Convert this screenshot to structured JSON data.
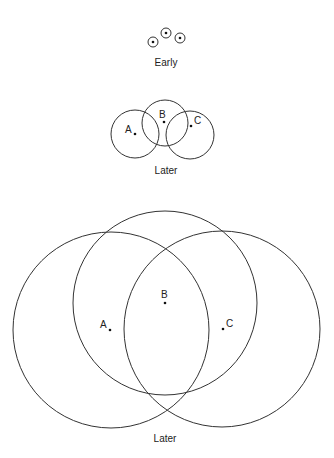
{
  "stages": [
    {
      "label": "Early",
      "circles": [
        {
          "cx": 153,
          "cy": 42,
          "r": 5
        },
        {
          "cx": 166,
          "cy": 33,
          "r": 5
        },
        {
          "cx": 180,
          "cy": 38,
          "r": 5
        }
      ]
    },
    {
      "label": "Later",
      "circles": [
        {
          "name": "A",
          "cx": 135,
          "cy": 134,
          "r": 24
        },
        {
          "name": "B",
          "cx": 165,
          "cy": 123,
          "r": 23
        },
        {
          "name": "C",
          "cx": 190,
          "cy": 135,
          "r": 24
        }
      ]
    },
    {
      "label": "Later",
      "circles": [
        {
          "name": "A",
          "cx": 111,
          "cy": 330,
          "r": 98
        },
        {
          "name": "B",
          "cx": 165,
          "cy": 303,
          "r": 92
        },
        {
          "name": "C",
          "cx": 222,
          "cy": 329,
          "r": 98
        }
      ]
    }
  ],
  "points": {
    "a": "A",
    "b": "B",
    "c": "C"
  }
}
